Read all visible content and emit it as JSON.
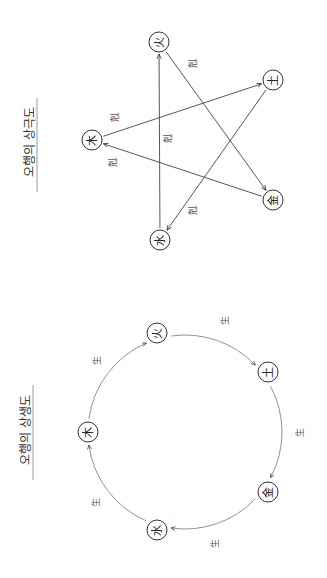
{
  "orientation": "rotated -90deg (content reads bottom-to-top)",
  "diagrams": [
    {
      "id": "sanggeuk",
      "title": "오행의 상극도",
      "title_pos": [
        30,
        142
      ],
      "underline": {
        "x": 37,
        "y1": 98,
        "y2": 192
      },
      "nodes": [
        {
          "key": "wood",
          "glyph": "木",
          "x": 92,
          "y": 140
        },
        {
          "key": "fire",
          "glyph": "火",
          "x": 159,
          "y": 42
        },
        {
          "key": "earth",
          "glyph": "土",
          "x": 273,
          "y": 80
        },
        {
          "key": "metal",
          "glyph": "金",
          "x": 273,
          "y": 200
        },
        {
          "key": "water",
          "glyph": "水",
          "x": 160,
          "y": 240
        }
      ],
      "edges": [
        {
          "from": "wood",
          "to": "earth",
          "label": "剋",
          "label_pos": [
            115,
            117
          ]
        },
        {
          "from": "earth",
          "to": "water",
          "label": "剋",
          "label_pos": [
            193,
            210
          ]
        },
        {
          "from": "water",
          "to": "fire",
          "label": "剋",
          "label_pos": [
            168,
            138
          ]
        },
        {
          "from": "fire",
          "to": "metal",
          "label": "剋",
          "label_pos": [
            193,
            63
          ]
        },
        {
          "from": "metal",
          "to": "wood",
          "label": "剋",
          "label_pos": [
            113,
            162
          ]
        }
      ]
    },
    {
      "id": "sangsaeng",
      "title": "오행의 상생도",
      "title_pos": [
        26,
        430
      ],
      "underline": {
        "x": 33,
        "y1": 385,
        "y2": 480
      },
      "center": [
        185,
        432
      ],
      "radius": 97,
      "nodes": [
        {
          "key": "wood",
          "glyph": "木",
          "x": 88,
          "y": 432
        },
        {
          "key": "fire",
          "glyph": "火",
          "x": 157,
          "y": 333
        },
        {
          "key": "earth",
          "glyph": "土",
          "x": 268,
          "y": 372
        },
        {
          "key": "metal",
          "glyph": "金",
          "x": 268,
          "y": 492
        },
        {
          "key": "water",
          "glyph": "水",
          "x": 157,
          "y": 530
        }
      ],
      "edges": [
        {
          "from": "wood",
          "to": "fire",
          "label": "生",
          "label_pos": [
            97,
            360
          ]
        },
        {
          "from": "fire",
          "to": "earth",
          "label": "生",
          "label_pos": [
            225,
            320
          ]
        },
        {
          "from": "earth",
          "to": "metal",
          "label": "生",
          "label_pos": [
            300,
            432
          ]
        },
        {
          "from": "metal",
          "to": "water",
          "label": "生",
          "label_pos": [
            215,
            543
          ]
        },
        {
          "from": "water",
          "to": "wood",
          "label": "生",
          "label_pos": [
            96,
            502
          ]
        }
      ]
    }
  ],
  "style": {
    "node_radius": 10,
    "line_color": "#444444",
    "background": "#ffffff"
  }
}
